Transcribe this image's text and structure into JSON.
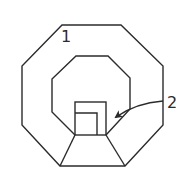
{
  "diagram": {
    "type": "line-drawing",
    "labels": [
      {
        "id": "1",
        "text": "1",
        "target": "outer-octagon-region"
      },
      {
        "id": "2",
        "text": "2",
        "target": "inner-square-niche"
      }
    ],
    "colors": {
      "stroke": "#2b2b2b",
      "background": "#ffffff"
    }
  }
}
